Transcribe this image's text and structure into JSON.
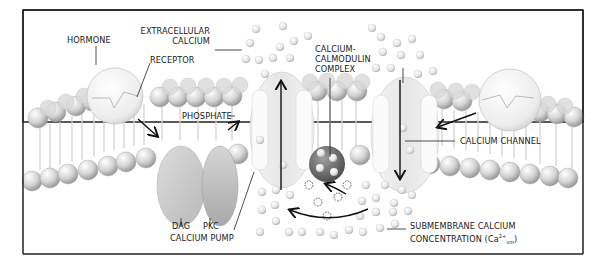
{
  "labels": {
    "hormone": "HORMONE",
    "extracellular_calcium_1": "EXTRACELLULAR",
    "extracellular_calcium_2": "CALCIUM",
    "receptor": "RECEPTOR",
    "calmodulin_1": "CALCIUM-",
    "calmodulin_2": "CALMODULIN",
    "calmodulin_3": "COMPLEX",
    "phosphate": "PHOSPHATE",
    "calcium_channel": "CALCIUM CHANNEL",
    "dag": "DAG",
    "pkc": "PKC",
    "calcium_pump": "CALCIUM PUMP",
    "submembrane_1": "SUBMEMBRANE CALCIUM",
    "submembrane_2": "CONCENTRATION (Ca",
    "submembrane_sup": "2+",
    "submembrane_sub": "sm",
    "submembrane_close": ")"
  },
  "colors": {
    "lipid_head": "#cfcfcf",
    "lipid_tail": "#e2e2e2",
    "protein": "#eeeeee",
    "dag": "#cdcdcd",
    "pkc": "#c4c4c4",
    "calmodulin": "#7a7a7a",
    "ink": "#1a1a1a"
  }
}
